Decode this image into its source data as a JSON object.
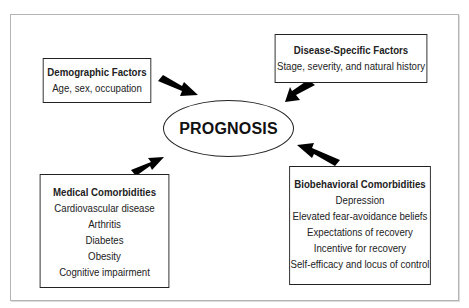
{
  "diagram": {
    "center": {
      "label": "PROGNOSIS"
    },
    "boxes": {
      "demographic": {
        "title": "Demographic Factors",
        "items": [
          "Age, sex, occupation"
        ]
      },
      "disease": {
        "title": "Disease-Specific Factors",
        "items": [
          "Stage, severity, and natural history"
        ]
      },
      "medical": {
        "title": "Medical Comorbidities",
        "items": [
          "Cardiovascular disease",
          "Arthritis",
          "Diabetes",
          "Obesity",
          "Cognitive impairment"
        ]
      },
      "biobehavioral": {
        "title": "Biobehavioral Comorbidities",
        "items": [
          "Depression",
          "Elevated fear-avoidance beliefs",
          "Expectations of recovery",
          "Incentive for recovery",
          "Self-efficacy and locus of control"
        ]
      }
    },
    "edges": [
      {
        "from": "demographic",
        "to": "center"
      },
      {
        "from": "disease",
        "to": "center"
      },
      {
        "from": "medical",
        "to": "center"
      },
      {
        "from": "biobehavioral",
        "to": "center"
      }
    ],
    "colors": {
      "stroke": "#222222",
      "frame": "#b5b5b5",
      "arrow": "#000000"
    }
  }
}
